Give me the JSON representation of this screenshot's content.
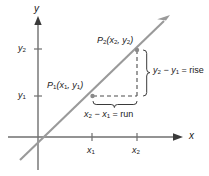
{
  "figure": {
    "background_color": "#ffffff",
    "axis_color": "#6f6f6f",
    "line_color": "#8c8c8c",
    "dash_color": "#4d4d4d",
    "text_color": "#1a1a1a"
  },
  "axes": {
    "x_label": "x",
    "y_label": "y",
    "x_ticks": [
      {
        "label_main": "x",
        "label_sub": "1"
      },
      {
        "label_main": "x",
        "label_sub": "2"
      }
    ],
    "y_ticks": [
      {
        "label_main": "y",
        "label_sub": "1"
      },
      {
        "label_main": "y",
        "label_sub": "2"
      }
    ]
  },
  "points": [
    {
      "name": "P1",
      "label_p": "P",
      "label_p_sub": "1",
      "label_coords": "(x",
      "label_x_sub": "1",
      "label_comma": ", y",
      "label_y_sub": "1",
      "label_close": ")",
      "full_text": "P1(x1, y1)"
    },
    {
      "name": "P2",
      "label_p": "P",
      "label_p_sub": "2",
      "label_coords": "(x",
      "label_x_sub": "2",
      "label_comma": ", y",
      "label_y_sub": "2",
      "label_close": ")",
      "full_text": "P2(x2, y2)"
    }
  ],
  "annotations": {
    "rise": {
      "lead": "y",
      "lead_sub": "2",
      "minus": " − y",
      "minus_sub": "1",
      "equals": " = ",
      "word": "rise",
      "full_text": "y2 − y1 = rise"
    },
    "run": {
      "lead": "x",
      "lead_sub": "2",
      "minus": " − x",
      "minus_sub": "1",
      "equals": " = ",
      "word": "run",
      "full_text": "x2 − x1 = run"
    }
  }
}
